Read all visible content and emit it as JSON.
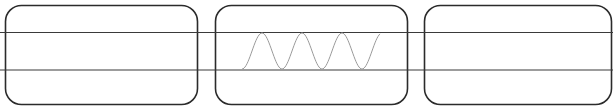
{
  "diagram": {
    "title": "",
    "panels": [
      {
        "id": "panel-left",
        "x": 5,
        "y": 5,
        "width": 192,
        "height": 99,
        "radius": 16,
        "content": "empty"
      },
      {
        "id": "panel-center",
        "x": 215,
        "y": 5,
        "width": 192,
        "height": 99,
        "radius": 16,
        "content": "sine-wave"
      },
      {
        "id": "panel-right",
        "x": 424,
        "y": 5,
        "width": 187,
        "height": 99,
        "radius": 16,
        "content": "empty"
      }
    ],
    "horizontal_lines": [
      {
        "id": "upper-line",
        "y": 32.5
      },
      {
        "id": "lower-line",
        "y": 70
      }
    ],
    "wave": {
      "x_start": 242,
      "x_end": 380,
      "y_top": 33,
      "y_bottom": 69,
      "period": 40,
      "color": "#9a9a9a"
    },
    "colors": {
      "outline": "#2b2b2b",
      "line": "#3a3a3a",
      "wave": "#9a9a9a",
      "background": "#ffffff"
    }
  }
}
